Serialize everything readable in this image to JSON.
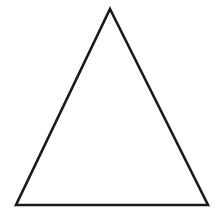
{
  "canvas": {
    "width": 219,
    "height": 214,
    "background_color": "#ffffff",
    "has_frame": false,
    "caption": ""
  },
  "figure": {
    "name": "triangle",
    "shape_type": "triangle",
    "classification": "isosceles-triangle",
    "orientation": "apex-up",
    "fill_color": "#ffffff",
    "filled": false,
    "stroke_color": "#1a1a1a",
    "stroke_width": 2.6,
    "vertex_count": 3,
    "vertices": [
      {
        "label": "apex",
        "x": 110,
        "y": 9
      },
      {
        "label": "bottom-right",
        "x": 208,
        "y": 205
      },
      {
        "label": "bottom-left",
        "x": 16,
        "y": 205
      }
    ],
    "points_attr": "110,9 208,205 16,205",
    "base_width": 192,
    "height_px": 196,
    "symmetry_axis_x": 112
  }
}
